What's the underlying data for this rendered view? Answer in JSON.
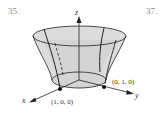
{
  "exercise_numbers": [
    "35.",
    "37."
  ],
  "figure": {
    "axes": {
      "x": "x",
      "y": "y",
      "z": "z"
    },
    "points": [
      {
        "label": "(1, 0, 0)"
      },
      {
        "label": "(0, 1, 0)"
      }
    ],
    "colors": {
      "surface_fill": "#d9d9d9",
      "line": "#222222"
    }
  }
}
